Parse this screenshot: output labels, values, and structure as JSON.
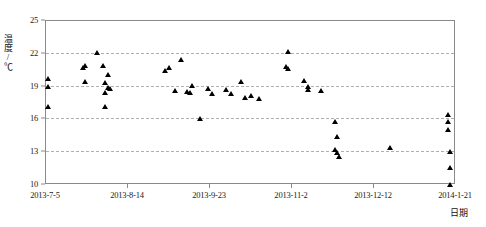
{
  "chart_data": {
    "type": "scatter",
    "title": "",
    "xlabel": "日期",
    "ylabel": "温度/℃",
    "ylim": [
      10,
      25
    ],
    "yticks": [
      10,
      13,
      16,
      19,
      22,
      25
    ],
    "gridlines_y": [
      13,
      16,
      19,
      22
    ],
    "grid": true,
    "legend": "none",
    "xlim": [
      "2013-7-5",
      "2014-1-21"
    ],
    "xticks": [
      "2013-7-5",
      "2013-8-14",
      "2013-9-23",
      "2013-11-2",
      "2013-12-12",
      "2014-1-21"
    ],
    "xtick_day_offsets": [
      0,
      40,
      80,
      120,
      160,
      200
    ],
    "marker": "triangle-filled-black",
    "series": [
      {
        "name": "温度",
        "points": [
          {
            "day": 1,
            "temp": 19.7
          },
          {
            "day": 1,
            "temp": 19.0
          },
          {
            "day": 1,
            "temp": 17.1
          },
          {
            "day": 18,
            "temp": 20.7
          },
          {
            "day": 19,
            "temp": 20.9
          },
          {
            "day": 19,
            "temp": 19.4
          },
          {
            "day": 25,
            "temp": 22.1
          },
          {
            "day": 28,
            "temp": 20.9
          },
          {
            "day": 30,
            "temp": 20.1
          },
          {
            "day": 29,
            "temp": 19.3
          },
          {
            "day": 30,
            "temp": 18.9
          },
          {
            "day": 31,
            "temp": 18.8
          },
          {
            "day": 29,
            "temp": 18.4
          },
          {
            "day": 29,
            "temp": 17.1
          },
          {
            "day": 58,
            "temp": 20.4
          },
          {
            "day": 60,
            "temp": 20.7
          },
          {
            "day": 66,
            "temp": 21.4
          },
          {
            "day": 71,
            "temp": 19.1
          },
          {
            "day": 63,
            "temp": 18.6
          },
          {
            "day": 69,
            "temp": 18.5
          },
          {
            "day": 70,
            "temp": 18.4
          },
          {
            "day": 79,
            "temp": 18.8
          },
          {
            "day": 81,
            "temp": 18.3
          },
          {
            "day": 75,
            "temp": 16.0
          },
          {
            "day": 95,
            "temp": 19.4
          },
          {
            "day": 88,
            "temp": 18.7
          },
          {
            "day": 90,
            "temp": 18.3
          },
          {
            "day": 97,
            "temp": 18.0
          },
          {
            "day": 100,
            "temp": 18.1
          },
          {
            "day": 104,
            "temp": 17.9
          },
          {
            "day": 118,
            "temp": 22.2
          },
          {
            "day": 117,
            "temp": 20.8
          },
          {
            "day": 118,
            "temp": 20.6
          },
          {
            "day": 126,
            "temp": 19.5
          },
          {
            "day": 128,
            "temp": 19.0
          },
          {
            "day": 128,
            "temp": 18.7
          },
          {
            "day": 134,
            "temp": 18.6
          },
          {
            "day": 141,
            "temp": 15.8
          },
          {
            "day": 142,
            "temp": 14.4
          },
          {
            "day": 141,
            "temp": 13.2
          },
          {
            "day": 142,
            "temp": 12.9
          },
          {
            "day": 143,
            "temp": 12.6
          },
          {
            "day": 168,
            "temp": 13.4
          },
          {
            "day": 196,
            "temp": 16.4
          },
          {
            "day": 196,
            "temp": 15.8
          },
          {
            "day": 196,
            "temp": 15.0
          },
          {
            "day": 197,
            "temp": 13.0
          },
          {
            "day": 197,
            "temp": 11.6
          },
          {
            "day": 197,
            "temp": 10.0
          }
        ]
      }
    ]
  }
}
